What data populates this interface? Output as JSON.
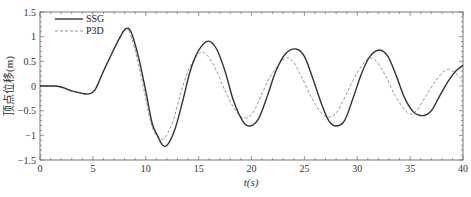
{
  "chart_data": {
    "type": "line",
    "title": "",
    "xlabel": "t(s)",
    "ylabel": "顶点位移(m)",
    "xlim": [
      0,
      40
    ],
    "ylim": [
      -1.5,
      1.5
    ],
    "xticks": [
      0,
      5,
      10,
      15,
      20,
      25,
      30,
      35,
      40
    ],
    "yticks": [
      1.5,
      1,
      0.5,
      0,
      -0.5,
      -1,
      -1.5
    ],
    "ytick_labels": [
      "1.5",
      "1",
      "0.5",
      "0",
      "−0.5",
      "−1",
      "−1.5"
    ],
    "grid": false,
    "legend_position": "upper left",
    "series": [
      {
        "name": "SSG",
        "style": "solid",
        "color": "#333333",
        "x": [
          0,
          1,
          2,
          3,
          4,
          4.6,
          5.2,
          6,
          7,
          7.6,
          8.1,
          8.6,
          9.3,
          10,
          10.6,
          11.1,
          11.6,
          12.1,
          12.8,
          13.5,
          14.2,
          15,
          15.9,
          16.7,
          17.5,
          18.3,
          19.2,
          19.9,
          20.7,
          21.5,
          22.3,
          23.2,
          24.2,
          25,
          25.8,
          26.6,
          27.3,
          28,
          28.8,
          29.6,
          30.4,
          31.2,
          32.1,
          32.9,
          33.7,
          34.5,
          35.3,
          36.2,
          37,
          37.8,
          38.6,
          39.3,
          40
        ],
        "y": [
          0,
          0,
          -0.02,
          -0.1,
          -0.15,
          -0.16,
          -0.08,
          0.3,
          0.75,
          1.0,
          1.16,
          1.1,
          0.6,
          -0.1,
          -0.75,
          -1.0,
          -1.2,
          -1.18,
          -0.85,
          -0.3,
          0.3,
          0.72,
          0.91,
          0.75,
          0.3,
          -0.3,
          -0.72,
          -0.81,
          -0.65,
          -0.2,
          0.3,
          0.65,
          0.75,
          0.6,
          0.15,
          -0.35,
          -0.7,
          -0.81,
          -0.7,
          -0.25,
          0.25,
          0.6,
          0.73,
          0.6,
          0.2,
          -0.25,
          -0.52,
          -0.6,
          -0.5,
          -0.2,
          0.1,
          0.3,
          0.42
        ]
      },
      {
        "name": "P3D",
        "style": "dashed",
        "color": "#888888",
        "x": [
          0,
          1,
          2,
          3,
          4,
          4.6,
          5.2,
          6,
          7,
          7.6,
          8.0,
          8.5,
          9.2,
          9.9,
          10.5,
          11.0,
          11.4,
          11.9,
          12.6,
          13.3,
          14.1,
          15.1,
          15.9,
          16.7,
          17.5,
          18.5,
          19.3,
          20.1,
          20.9,
          21.8,
          23.1,
          23.9,
          24.7,
          25.6,
          26.5,
          27.2,
          28.0,
          28.9,
          29.8,
          31.0,
          31.8,
          32.7,
          33.6,
          34.8,
          35.6,
          36.5,
          37.4,
          38.4,
          39.2,
          40
        ],
        "y": [
          0,
          0,
          -0.02,
          -0.1,
          -0.15,
          -0.16,
          -0.08,
          0.3,
          0.75,
          1.0,
          1.15,
          1.08,
          0.55,
          -0.15,
          -0.75,
          -1.0,
          -1.08,
          -1.02,
          -0.7,
          -0.15,
          0.35,
          0.67,
          0.6,
          0.3,
          -0.1,
          -0.5,
          -0.65,
          -0.55,
          -0.2,
          0.2,
          0.55,
          0.5,
          0.2,
          -0.2,
          -0.52,
          -0.63,
          -0.55,
          -0.2,
          0.2,
          0.55,
          0.5,
          0.2,
          -0.2,
          -0.55,
          -0.5,
          -0.2,
          0.1,
          0.33,
          0.28,
          0.1
        ]
      }
    ]
  }
}
